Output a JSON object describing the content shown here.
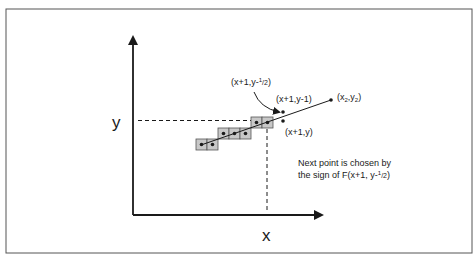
{
  "diagram": {
    "axis_labels": {
      "x": "x",
      "y": "y"
    },
    "point_labels": {
      "midpoint": {
        "main": "(x+1,y-",
        "sup": "1",
        "sub": "/2",
        "close": ")"
      },
      "upper": "(x+1,y-1)",
      "lower": "(x+1,y)",
      "end": {
        "pre": "(x",
        "s1": "2",
        "mid": ",y",
        "s2": "2",
        "close": ")"
      }
    },
    "note": {
      "line1": "Next point is chosen by",
      "line2_main": "the sign of F(x+1, y-",
      "line2_sup": "1",
      "line2_sub": "/2",
      "line2_close": ")"
    },
    "colors": {
      "pixel_fill": "#c8c8c8",
      "stroke": "#1a1a1a",
      "frame": "#555555"
    }
  }
}
